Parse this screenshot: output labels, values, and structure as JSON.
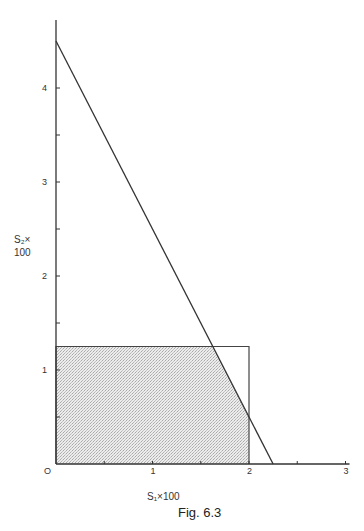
{
  "figure": {
    "caption": "Fig. 6.3"
  },
  "chart_data": {
    "type": "line",
    "title": "",
    "caption": "Fig. 6.3",
    "xlabel": "S₁×100",
    "ylabel_line1": "S₂×",
    "ylabel_line2": "100",
    "xlim": [
      0,
      3
    ],
    "ylim": [
      0,
      4.7
    ],
    "x_ticks": [
      0,
      0.5,
      1,
      1.5,
      2,
      2.5,
      3
    ],
    "x_tick_labels": [
      {
        "value": 0,
        "label": "O"
      },
      {
        "value": 1,
        "label": "1"
      },
      {
        "value": 2,
        "label": "2"
      },
      {
        "value": 3,
        "label": "3"
      }
    ],
    "y_ticks": [
      0.5,
      1,
      1.5,
      2,
      2.5,
      3,
      3.5,
      4
    ],
    "y_tick_labels": [
      {
        "value": 1,
        "label": "1"
      },
      {
        "value": 2,
        "label": "2"
      },
      {
        "value": 3,
        "label": "3"
      },
      {
        "value": 4,
        "label": "4"
      }
    ],
    "grid": false,
    "series": [
      {
        "name": "constraint line",
        "type": "line",
        "points": [
          [
            0,
            4.5
          ],
          [
            2.25,
            0
          ]
        ]
      },
      {
        "name": "bounding rectangle",
        "type": "rectangle",
        "points": [
          [
            0,
            0
          ],
          [
            0,
            1.25
          ],
          [
            2,
            1.25
          ],
          [
            2,
            0
          ]
        ]
      },
      {
        "name": "feasible region (shaded)",
        "type": "area",
        "points": [
          [
            0,
            0
          ],
          [
            0,
            1.25
          ],
          [
            1.625,
            1.25
          ],
          [
            2,
            0.5
          ],
          [
            2,
            0
          ]
        ]
      }
    ]
  }
}
